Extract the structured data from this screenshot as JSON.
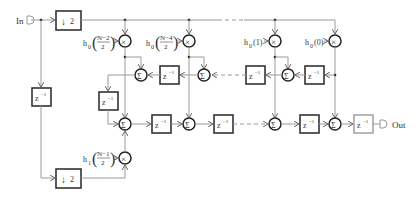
{
  "diagram": {
    "type": "polyphase decimation FIR filter block diagram",
    "input_label": "In",
    "output_label": "Out",
    "downsampler_label": "2",
    "delay_label": "z",
    "delay_exp": "−1",
    "sum_symbol": "Σ",
    "mult_symbol": "×",
    "coefficients": {
      "c1": {
        "h": "h",
        "sub": "0",
        "num": "N−2",
        "den": "2"
      },
      "c2": {
        "h": "h",
        "sub": "0",
        "num": "N−4",
        "den": "2"
      },
      "c3": {
        "h": "h",
        "sub": "0",
        "arg": "(1)"
      },
      "c4": {
        "h": "h",
        "sub": "0",
        "arg": "(0)"
      },
      "c5": {
        "h": "h",
        "sub": "1",
        "num": "N−1",
        "den": "2"
      }
    }
  }
}
